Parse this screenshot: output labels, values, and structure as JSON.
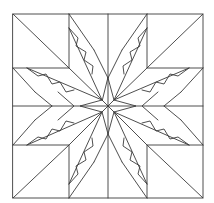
{
  "image": {
    "description": "Feathered eight-pointed star quilt block, line-art coloring page",
    "stroke_color": "#3a3a3a",
    "background_color": "#ffffff"
  },
  "block": {
    "x0": 13,
    "y0": 14,
    "x1": 203,
    "y1": 198,
    "center": [
      108,
      106
    ],
    "grid_x": [
      13,
      69,
      108,
      147,
      203
    ],
    "grid_y": [
      14,
      68,
      106,
      145,
      198
    ]
  },
  "parts": {
    "corner_squares": 4,
    "star_points": 8,
    "feather_bands": 8,
    "center_star_points": 4
  }
}
